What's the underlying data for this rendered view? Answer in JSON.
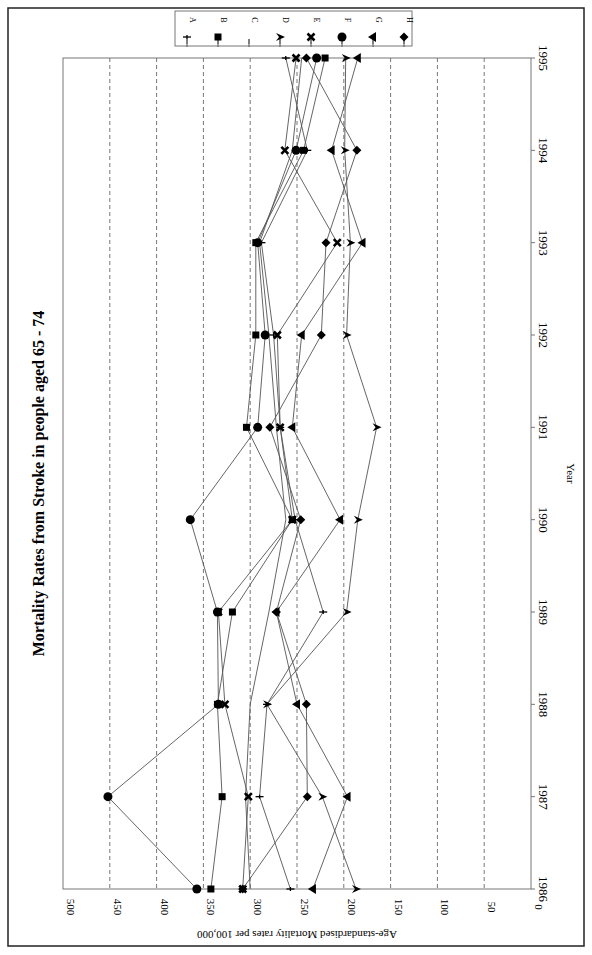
{
  "chart_data": {
    "type": "line",
    "title": "Mortality Rates from Stroke in people aged 65 - 74",
    "xlabel": "Year",
    "ylabel": "Age-standardised Mortality rates per 100,000",
    "orientation": "rotated-90-clockwise",
    "categories": [
      1986,
      1987,
      1988,
      1989,
      1990,
      1991,
      1992,
      1993,
      1994,
      1995
    ],
    "ylim": [
      0,
      500
    ],
    "yticks": [
      0,
      50,
      100,
      150,
      200,
      250,
      300,
      350,
      400,
      450,
      500
    ],
    "grid": "dashed horizontal at every 50",
    "legend_position": "top-right",
    "series": [
      {
        "name": "A",
        "marker": "plus",
        "values": [
          257,
          290,
          282,
          222,
          252,
          268,
          275,
          288,
          239,
          262
        ]
      },
      {
        "name": "B",
        "marker": "square",
        "values": [
          342,
          330,
          335,
          319,
          255,
          304,
          294,
          294,
          243,
          220
        ]
      },
      {
        "name": "C",
        "marker": "none",
        "values": [
          300,
          305,
          300,
          280,
          262,
          272,
          280,
          290,
          255,
          245
        ]
      },
      {
        "name": "D",
        "marker": "triangle-up",
        "values": [
          187,
          223,
          282,
          197,
          185,
          165,
          197,
          193,
          199,
          198
        ]
      },
      {
        "name": "E",
        "marker": "x",
        "values": [
          308,
          302,
          327,
          334,
          255,
          268,
          271,
          207,
          263,
          251
        ]
      },
      {
        "name": "F",
        "marker": "circle",
        "values": [
          357,
          452,
          334,
          335,
          364,
          292,
          284,
          292,
          251,
          229
        ]
      },
      {
        "name": "G",
        "marker": "triangle-left",
        "values": [
          233,
          196,
          250,
          272,
          204,
          255,
          245,
          180,
          213,
          185
        ]
      },
      {
        "name": "H",
        "marker": "diamond",
        "values": [
          308,
          239,
          240,
          272,
          246,
          279,
          224,
          219,
          186,
          240
        ]
      }
    ]
  }
}
